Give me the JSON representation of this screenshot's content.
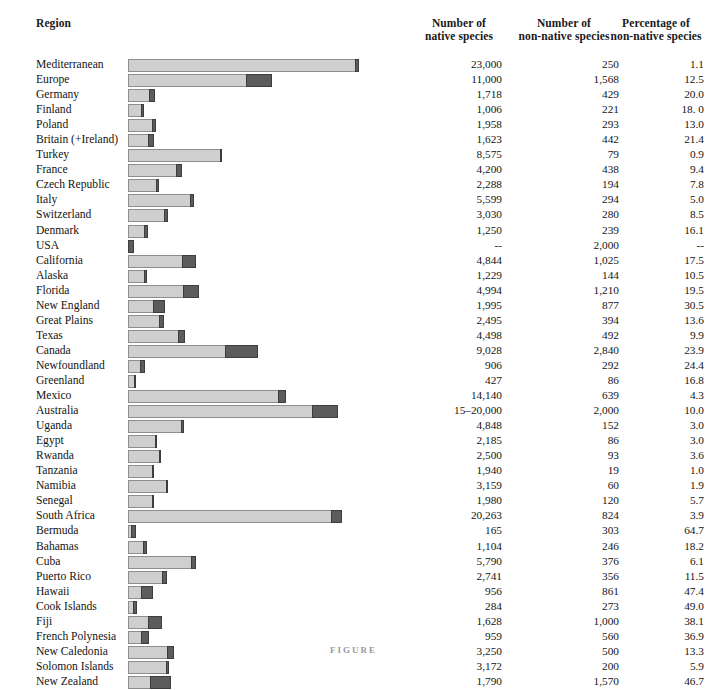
{
  "header": {
    "region": "Region",
    "native_l1": "Number of",
    "native_l2": "native species",
    "nonnative_l1": "Number of",
    "nonnative_l2": "non-native species",
    "percentage_l1": "Percentage of",
    "percentage_l2": "non-native species"
  },
  "caption": "FIGURE",
  "colors": {
    "native_fill": "#cfcfcf",
    "native_stroke": "#8e8e8e",
    "nonnative_fill": "#5c5c5c",
    "nonnative_stroke": "#3d3d3d",
    "text": "#141414",
    "background": "#ffffff"
  },
  "chart_data": {
    "type": "bar",
    "subtype": "horizontal-stacked",
    "title": "",
    "xlabel": "",
    "ylabel": "Region",
    "grid": false,
    "legend": "none",
    "axis_visible": false,
    "categories": [
      "Mediterranean",
      "Europe",
      "Germany",
      "Finland",
      "Poland",
      "Britain (+Ireland)",
      "Turkey",
      "France",
      "Czech Republic",
      "Italy",
      "Switzerland",
      "Denmark",
      "USA",
      "California",
      "Alaska",
      "Florida",
      "New England",
      "Great Plains",
      "Texas",
      "Canada",
      "Newfoundland",
      "Greenland",
      "Mexico",
      "Australia",
      "Uganda",
      "Egypt",
      "Rwanda",
      "Tanzania",
      "Namibia",
      "Senegal",
      "South Africa",
      "Bermuda",
      "Bahamas",
      "Cuba",
      "Puerto Rico",
      "Hawaii",
      "Cook Islands",
      "Fiji",
      "French Polynesia",
      "New Caledonia",
      "Solomon Islands",
      "New Zealand"
    ],
    "series": [
      {
        "name": "native species",
        "values": [
          23000,
          11000,
          1718,
          1006,
          1958,
          1623,
          8575,
          4200,
          2288,
          5599,
          3030,
          1250,
          null,
          4844,
          1229,
          4994,
          1995,
          2495,
          4498,
          9028,
          906,
          427,
          14140,
          17500,
          4848,
          2185,
          2500,
          1940,
          3159,
          1980,
          20263,
          165,
          1104,
          5790,
          2741,
          956,
          284,
          1628,
          959,
          3250,
          3172,
          1790
        ]
      },
      {
        "name": "non-native species",
        "values": [
          250,
          1568,
          429,
          221,
          293,
          442,
          79,
          438,
          194,
          294,
          280,
          239,
          2000,
          1025,
          144,
          1210,
          877,
          394,
          492,
          2840,
          292,
          86,
          639,
          2000,
          152,
          86,
          93,
          19,
          60,
          120,
          824,
          303,
          246,
          376,
          356,
          861,
          273,
          1000,
          560,
          500,
          200,
          1570
        ]
      }
    ]
  },
  "rows": [
    {
      "region": "Mediterranean",
      "native": "23,000",
      "nonnative": "250",
      "pct": "1.1",
      "bar_native": 227,
      "bar_nonnative": 4
    },
    {
      "region": "Europe",
      "native": "11,000",
      "nonnative": "1,568",
      "pct": "12.5",
      "bar_native": 118,
      "bar_nonnative": 26
    },
    {
      "region": "Germany",
      "native": "1,718",
      "nonnative": "429",
      "pct": "20.0",
      "bar_native": 21,
      "bar_nonnative": 6
    },
    {
      "region": "Finland",
      "native": "1,006",
      "nonnative": "221",
      "pct": "18. 0",
      "bar_native": 13,
      "bar_nonnative": 3
    },
    {
      "region": "Poland",
      "native": "1,958",
      "nonnative": "293",
      "pct": "13.0",
      "bar_native": 24,
      "bar_nonnative": 4
    },
    {
      "region": "Britain (+Ireland)",
      "native": "1,623",
      "nonnative": "442",
      "pct": "21.4",
      "bar_native": 20,
      "bar_nonnative": 6
    },
    {
      "region": "Turkey",
      "native": "8,575",
      "nonnative": "79",
      "pct": "0.9",
      "bar_native": 92,
      "bar_nonnative": 2
    },
    {
      "region": "France",
      "native": "4,200",
      "nonnative": "438",
      "pct": "9.4",
      "bar_native": 48,
      "bar_nonnative": 6
    },
    {
      "region": "Czech Republic",
      "native": "2,288",
      "nonnative": "194",
      "pct": "7.8",
      "bar_native": 28,
      "bar_nonnative": 3
    },
    {
      "region": "Italy",
      "native": "5,599",
      "nonnative": "294",
      "pct": "5.0",
      "bar_native": 62,
      "bar_nonnative": 4
    },
    {
      "region": "Switzerland",
      "native": "3,030",
      "nonnative": "280",
      "pct": "8.5",
      "bar_native": 36,
      "bar_nonnative": 4
    },
    {
      "region": "Denmark",
      "native": "1,250",
      "nonnative": "239",
      "pct": "16.1",
      "bar_native": 16,
      "bar_nonnative": 4
    },
    {
      "region": "USA",
      "native": "--",
      "nonnative": "2,000",
      "pct": "--",
      "bar_native": 0,
      "bar_nonnative": 6
    },
    {
      "region": "California",
      "native": "4,844",
      "nonnative": "1,025",
      "pct": "17.5",
      "bar_native": 54,
      "bar_nonnative": 14
    },
    {
      "region": "Alaska",
      "native": "1,229",
      "nonnative": "144",
      "pct": "10.5",
      "bar_native": 16,
      "bar_nonnative": 3
    },
    {
      "region": "Florida",
      "native": "4,994",
      "nonnative": "1,210",
      "pct": "19.5",
      "bar_native": 55,
      "bar_nonnative": 16
    },
    {
      "region": "New England",
      "native": "1,995",
      "nonnative": "877",
      "pct": "30.5",
      "bar_native": 25,
      "bar_nonnative": 12
    },
    {
      "region": "Great Plains",
      "native": "2,495",
      "nonnative": "394",
      "pct": "13.6",
      "bar_native": 31,
      "bar_nonnative": 5
    },
    {
      "region": "Texas",
      "native": "4,498",
      "nonnative": "492",
      "pct": "9.9",
      "bar_native": 50,
      "bar_nonnative": 7
    },
    {
      "region": "Canada",
      "native": "9,028",
      "nonnative": "2,840",
      "pct": "23.9",
      "bar_native": 97,
      "bar_nonnative": 33
    },
    {
      "region": "Newfoundland",
      "native": "906",
      "nonnative": "292",
      "pct": "24.4",
      "bar_native": 12,
      "bar_nonnative": 5
    },
    {
      "region": "Greenland",
      "native": "427",
      "nonnative": "86",
      "pct": "16.8",
      "bar_native": 6,
      "bar_nonnative": 2
    },
    {
      "region": "Mexico",
      "native": "14,140",
      "nonnative": "639",
      "pct": "4.3",
      "bar_native": 150,
      "bar_nonnative": 8
    },
    {
      "region": "Australia",
      "native": "15–20,000",
      "nonnative": "2,000",
      "pct": "10.0",
      "bar_native": 184,
      "bar_nonnative": 26
    },
    {
      "region": "Uganda",
      "native": "4,848",
      "nonnative": "152",
      "pct": "3.0",
      "bar_native": 53,
      "bar_nonnative": 3
    },
    {
      "region": "Egypt",
      "native": "2,185",
      "nonnative": "86",
      "pct": "3.0",
      "bar_native": 27,
      "bar_nonnative": 2
    },
    {
      "region": "Rwanda",
      "native": "2,500",
      "nonnative": "93",
      "pct": "3.6",
      "bar_native": 31,
      "bar_nonnative": 2
    },
    {
      "region": "Tanzania",
      "native": "1,940",
      "nonnative": "19",
      "pct": "1.0",
      "bar_native": 24,
      "bar_nonnative": 2
    },
    {
      "region": "Namibia",
      "native": "3,159",
      "nonnative": "60",
      "pct": "1.9",
      "bar_native": 38,
      "bar_nonnative": 2
    },
    {
      "region": "Senegal",
      "native": "1,980",
      "nonnative": "120",
      "pct": "5.7",
      "bar_native": 24,
      "bar_nonnative": 2
    },
    {
      "region": "South Africa",
      "native": "20,263",
      "nonnative": "824",
      "pct": "3.9",
      "bar_native": 203,
      "bar_nonnative": 11
    },
    {
      "region": "Bermuda",
      "native": "165",
      "nonnative": "303",
      "pct": "64.7",
      "bar_native": 3,
      "bar_nonnative": 5
    },
    {
      "region": "Bahamas",
      "native": "1,104",
      "nonnative": "246",
      "pct": "18.2",
      "bar_native": 15,
      "bar_nonnative": 4
    },
    {
      "region": "Cuba",
      "native": "5,790",
      "nonnative": "376",
      "pct": "6.1",
      "bar_native": 63,
      "bar_nonnative": 5
    },
    {
      "region": "Puerto Rico",
      "native": "2,741",
      "nonnative": "356",
      "pct": "11.5",
      "bar_native": 34,
      "bar_nonnative": 5
    },
    {
      "region": "Hawaii",
      "native": "956",
      "nonnative": "861",
      "pct": "47.4",
      "bar_native": 13,
      "bar_nonnative": 12
    },
    {
      "region": "Cook Islands",
      "native": "284",
      "nonnative": "273",
      "pct": "49.0",
      "bar_native": 5,
      "bar_nonnative": 4
    },
    {
      "region": "Fiji",
      "native": "1,628",
      "nonnative": "1,000",
      "pct": "38.1",
      "bar_native": 20,
      "bar_nonnative": 14
    },
    {
      "region": "French Polynesia",
      "native": "959",
      "nonnative": "560",
      "pct": "36.9",
      "bar_native": 13,
      "bar_nonnative": 8
    },
    {
      "region": "New Caledonia",
      "native": "3,250",
      "nonnative": "500",
      "pct": "13.3",
      "bar_native": 39,
      "bar_nonnative": 7
    },
    {
      "region": "Solomon Islands",
      "native": "3,172",
      "nonnative": "200",
      "pct": "5.9",
      "bar_native": 38,
      "bar_nonnative": 3
    },
    {
      "region": "New Zealand",
      "native": "1,790",
      "nonnative": "1,570",
      "pct": "46.7",
      "bar_native": 22,
      "bar_nonnative": 21
    }
  ]
}
